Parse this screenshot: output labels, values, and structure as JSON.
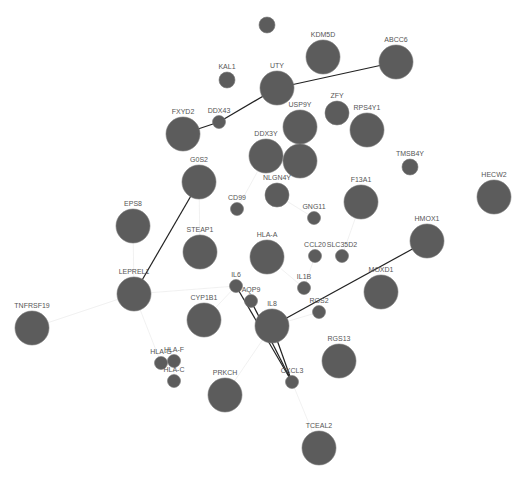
{
  "graph": {
    "title": "Gene interaction network",
    "node_color": "#5c5c5c",
    "strong_edge_color": "#222222",
    "faint_edge_color": "#eeeeee",
    "nodes": [
      {
        "id": "n0",
        "label": "",
        "size": "small"
      },
      {
        "id": "KDM5D",
        "label": "KDM5D",
        "size": "large"
      },
      {
        "id": "ABCC6",
        "label": "ABCC6",
        "size": "large"
      },
      {
        "id": "KAL1",
        "label": "KAL1",
        "size": "small"
      },
      {
        "id": "UTY",
        "label": "UTY",
        "size": "large"
      },
      {
        "id": "FXYD2",
        "label": "FXYD2",
        "size": "large"
      },
      {
        "id": "DDX43",
        "label": "DDX43",
        "size": "tiny"
      },
      {
        "id": "USP9Y",
        "label": "USP9Y",
        "size": "large"
      },
      {
        "id": "ZFY",
        "label": "ZFY",
        "size": "medium"
      },
      {
        "id": "RPS4Y1",
        "label": "RPS4Y1",
        "size": "large"
      },
      {
        "id": "DDX3Y",
        "label": "DDX3Y",
        "size": "large"
      },
      {
        "id": "n11",
        "label": "",
        "size": "large"
      },
      {
        "id": "TMSB4Y",
        "label": "TMSB4Y",
        "size": "small"
      },
      {
        "id": "G0S2",
        "label": "G0S2",
        "size": "large"
      },
      {
        "id": "NLGN4Y",
        "label": "NLGN4Y",
        "size": "medium"
      },
      {
        "id": "CD99",
        "label": "CD99",
        "size": "tiny"
      },
      {
        "id": "F13A1",
        "label": "F13A1",
        "size": "large"
      },
      {
        "id": "HECW2",
        "label": "HECW2",
        "size": "large"
      },
      {
        "id": "EPS8",
        "label": "EPS8",
        "size": "large"
      },
      {
        "id": "GNG11",
        "label": "GNG11",
        "size": "tiny"
      },
      {
        "id": "STEAP1",
        "label": "STEAP1",
        "size": "large"
      },
      {
        "id": "HLA-A",
        "label": "HLA-A",
        "size": "large"
      },
      {
        "id": "CCL20",
        "label": "CCL20",
        "size": "tiny"
      },
      {
        "id": "SLC35D2",
        "label": "SLC35D2",
        "size": "tiny"
      },
      {
        "id": "HMOX1",
        "label": "HMOX1",
        "size": "large"
      },
      {
        "id": "LEPREL1",
        "label": "LEPREL1",
        "size": "large"
      },
      {
        "id": "IL6",
        "label": "IL6",
        "size": "tiny"
      },
      {
        "id": "IL1B",
        "label": "IL1B",
        "size": "tiny"
      },
      {
        "id": "MOXD1",
        "label": "MOXD1",
        "size": "large"
      },
      {
        "id": "AQP9",
        "label": "AQP9",
        "size": "tiny"
      },
      {
        "id": "TNFRSF19",
        "label": "TNFRSF19",
        "size": "large"
      },
      {
        "id": "CYP1B1",
        "label": "CYP1B1",
        "size": "large"
      },
      {
        "id": "IL8",
        "label": "IL8",
        "size": "large"
      },
      {
        "id": "RGS2",
        "label": "RGS2",
        "size": "tiny"
      },
      {
        "id": "HLA-G",
        "label": "HLA-G",
        "size": "tiny"
      },
      {
        "id": "HLA-F",
        "label": "HLA-F",
        "size": "tiny"
      },
      {
        "id": "RGS13",
        "label": "RGS13",
        "size": "large"
      },
      {
        "id": "HLA-C",
        "label": "HLA-C",
        "size": "tiny"
      },
      {
        "id": "PRKCH",
        "label": "PRKCH",
        "size": "large"
      },
      {
        "id": "CXCL3",
        "label": "CXCL3",
        "size": "tiny"
      },
      {
        "id": "TCEAL2",
        "label": "TCEAL2",
        "size": "large"
      }
    ],
    "strong_edges": [
      [
        "FXYD2",
        "DDX43"
      ],
      [
        "DDX43",
        "UTY"
      ],
      [
        "UTY",
        "ABCC6"
      ],
      [
        "G0S2",
        "LEPREL1"
      ],
      [
        "IL6",
        "CXCL3"
      ],
      [
        "IL8",
        "CXCL3"
      ],
      [
        "AQP9",
        "CXCL3"
      ],
      [
        "IL8",
        "HMOX1"
      ]
    ],
    "faint_edges": [
      [
        "TNFRSF19",
        "LEPREL1"
      ],
      [
        "LEPREL1",
        "HLA-G"
      ],
      [
        "LEPREL1",
        "IL6"
      ],
      [
        "EPS8",
        "LEPREL1"
      ],
      [
        "CYP1B1",
        "IL6"
      ],
      [
        "HLA-A",
        "IL1B"
      ],
      [
        "IL8",
        "RGS2"
      ],
      [
        "IL8",
        "PRKCH"
      ],
      [
        "CXCL3",
        "TCEAL2"
      ],
      [
        "DDX3Y",
        "CD99"
      ],
      [
        "NLGN4Y",
        "GNG11"
      ],
      [
        "F13A1",
        "SLC35D2"
      ],
      [
        "CCL20",
        "IL1B"
      ],
      [
        "STEAP1",
        "G0S2"
      ],
      [
        "HLA-F",
        "HLA-C"
      ]
    ]
  }
}
